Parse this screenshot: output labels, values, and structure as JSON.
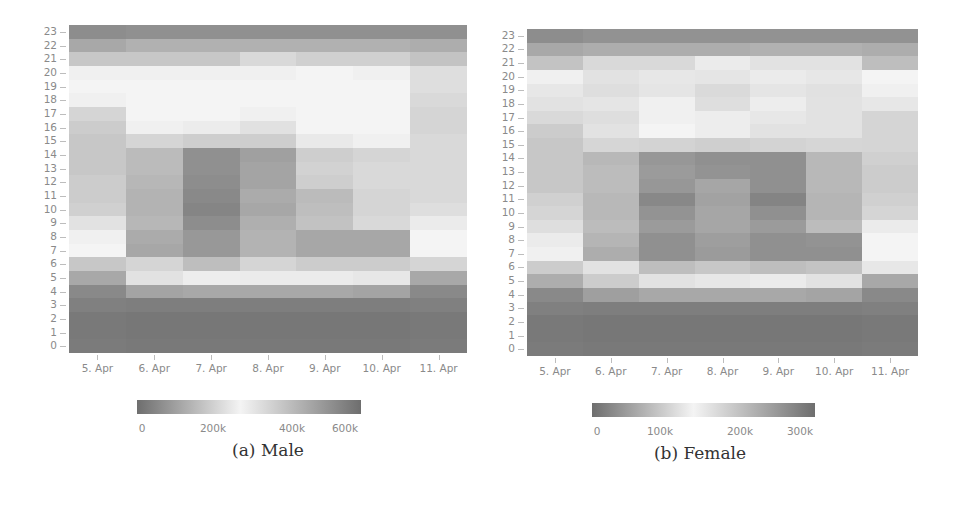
{
  "chart_data": [
    {
      "type": "heatmap",
      "title": "",
      "caption": "(a) Male",
      "xlabel": "",
      "ylabel": "",
      "x_categories": [
        "5. Apr",
        "6. Apr",
        "7. Apr",
        "8. Apr",
        "9. Apr",
        "10. Apr",
        "11. Apr"
      ],
      "y_categories": [
        "0",
        "1",
        "2",
        "3",
        "4",
        "5",
        "6",
        "7",
        "8",
        "9",
        "10",
        "11",
        "12",
        "13",
        "14",
        "15",
        "16",
        "17",
        "18",
        "19",
        "20",
        "21",
        "22",
        "23"
      ],
      "colorbar": {
        "min": 0,
        "max": 650000,
        "mid": 300000,
        "ticks": [
          "0",
          "200k",
          "400k",
          "600k"
        ],
        "tick_values": [
          0,
          200000,
          400000,
          600000
        ]
      },
      "values_by_hour": [
        [
          30000,
          25000,
          25000,
          25000,
          25000,
          25000,
          30000
        ],
        [
          25000,
          20000,
          20000,
          20000,
          20000,
          20000,
          25000
        ],
        [
          25000,
          20000,
          20000,
          20000,
          20000,
          20000,
          25000
        ],
        [
          40000,
          35000,
          35000,
          35000,
          35000,
          35000,
          40000
        ],
        [
          60000,
          120000,
          130000,
          130000,
          130000,
          120000,
          60000
        ],
        [
          130000,
          260000,
          285000,
          280000,
          280000,
          270000,
          130000
        ],
        [
          200000,
          230000,
          180000,
          230000,
          210000,
          210000,
          230000
        ],
        [
          300000,
          500000,
          540000,
          470000,
          500000,
          500000,
          300000
        ],
        [
          290000,
          490000,
          540000,
          470000,
          500000,
          500000,
          300000
        ],
        [
          260000,
          460000,
          570000,
          480000,
          430000,
          370000,
          280000
        ],
        [
          220000,
          470000,
          590000,
          500000,
          440000,
          380000,
          250000
        ],
        [
          210000,
          470000,
          580000,
          490000,
          450000,
          380000,
          240000
        ],
        [
          210000,
          460000,
          570000,
          510000,
          400000,
          370000,
          240000
        ],
        [
          200000,
          450000,
          560000,
          510000,
          390000,
          370000,
          240000
        ],
        [
          200000,
          450000,
          560000,
          520000,
          400000,
          380000,
          240000
        ],
        [
          200000,
          380000,
          400000,
          400000,
          330000,
          310000,
          240000
        ],
        [
          210000,
          310000,
          320000,
          350000,
          300000,
          300000,
          230000
        ],
        [
          230000,
          300000,
          300000,
          310000,
          300000,
          300000,
          230000
        ],
        [
          290000,
          300000,
          300000,
          300000,
          300000,
          300000,
          240000
        ],
        [
          300000,
          300000,
          300000,
          300000,
          300000,
          300000,
          250000
        ],
        [
          290000,
          290000,
          290000,
          290000,
          300000,
          290000,
          250000
        ],
        [
          200000,
          200000,
          200000,
          240000,
          220000,
          220000,
          190000
        ],
        [
          130000,
          150000,
          150000,
          150000,
          150000,
          150000,
          140000
        ],
        [
          70000,
          75000,
          75000,
          75000,
          75000,
          75000,
          75000
        ]
      ]
    },
    {
      "type": "heatmap",
      "title": "",
      "caption": "(b) Female",
      "xlabel": "",
      "ylabel": "",
      "x_categories": [
        "5. Apr",
        "6. Apr",
        "7. Apr",
        "8. Apr",
        "9. Apr",
        "10. Apr",
        "11. Apr"
      ],
      "y_categories": [
        "0",
        "1",
        "2",
        "3",
        "4",
        "5",
        "6",
        "7",
        "8",
        "9",
        "10",
        "11",
        "12",
        "13",
        "14",
        "15",
        "16",
        "17",
        "18",
        "19",
        "20",
        "21",
        "22",
        "23"
      ],
      "colorbar": {
        "min": 0,
        "max": 330000,
        "mid": 150000,
        "ticks": [
          "0",
          "100k",
          "200k",
          "300k"
        ],
        "tick_values": [
          0,
          100000,
          200000,
          300000
        ]
      },
      "values_by_hour": [
        [
          15000,
          12000,
          12000,
          12000,
          12000,
          12000,
          15000
        ],
        [
          12000,
          10000,
          10000,
          10000,
          10000,
          10000,
          12000
        ],
        [
          12000,
          10000,
          10000,
          10000,
          10000,
          10000,
          12000
        ],
        [
          20000,
          18000,
          18000,
          18000,
          18000,
          18000,
          20000
        ],
        [
          30000,
          55000,
          65000,
          65000,
          65000,
          60000,
          30000
        ],
        [
          70000,
          105000,
          130000,
          135000,
          140000,
          130000,
          65000
        ],
        [
          105000,
          130000,
          90000,
          100000,
          90000,
          95000,
          135000
        ],
        [
          145000,
          245000,
          285000,
          270000,
          285000,
          285000,
          150000
        ],
        [
          140000,
          235000,
          285000,
          265000,
          285000,
          280000,
          150000
        ],
        [
          125000,
          225000,
          270000,
          255000,
          270000,
          225000,
          140000
        ],
        [
          115000,
          230000,
          280000,
          255000,
          285000,
          235000,
          115000
        ],
        [
          110000,
          230000,
          295000,
          260000,
          300000,
          235000,
          110000
        ],
        [
          100000,
          225000,
          275000,
          255000,
          285000,
          230000,
          105000
        ],
        [
          100000,
          225000,
          270000,
          280000,
          285000,
          230000,
          105000
        ],
        [
          100000,
          230000,
          275000,
          285000,
          285000,
          230000,
          110000
        ],
        [
          100000,
          190000,
          195000,
          200000,
          195000,
          190000,
          115000
        ],
        [
          105000,
          130000,
          150000,
          160000,
          130000,
          130000,
          115000
        ],
        [
          120000,
          125000,
          145000,
          160000,
          135000,
          130000,
          115000
        ],
        [
          130000,
          170000,
          145000,
          180000,
          160000,
          130000,
          135000
        ],
        [
          135000,
          180000,
          170000,
          185000,
          170000,
          175000,
          145000
        ],
        [
          145000,
          130000,
          135000,
          170000,
          140000,
          135000,
          150000
        ],
        [
          95000,
          120000,
          120000,
          140000,
          130000,
          130000,
          90000
        ],
        [
          65000,
          70000,
          70000,
          70000,
          75000,
          75000,
          70000
        ],
        [
          35000,
          40000,
          40000,
          40000,
          40000,
          40000,
          40000
        ]
      ]
    }
  ],
  "figure": {
    "male": {
      "caption": "(a) Male",
      "cbar_ticks": [
        "0",
        "200k",
        "400k",
        "600k"
      ]
    },
    "female": {
      "caption": "(b) Female",
      "cbar_ticks": [
        "0",
        "100k",
        "200k",
        "300k"
      ]
    }
  },
  "colors": {
    "low": "#6e6e6e",
    "mid": "#f4f4f4",
    "high": "#6e6e6e",
    "axis_text": "#8a8a8a"
  }
}
